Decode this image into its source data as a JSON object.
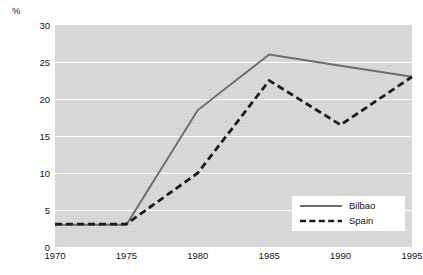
{
  "chart_data": {
    "type": "line",
    "title": "",
    "subtitle": "",
    "xlabel": "",
    "ylabel": "%",
    "x": [
      1970,
      1975,
      1980,
      1985,
      1990,
      1995
    ],
    "xtick_labels": [
      "1970",
      "1975",
      "1980",
      "1985",
      "1990",
      "1995"
    ],
    "ytick_labels": [
      "0",
      "5",
      "10",
      "15",
      "20",
      "25",
      "30"
    ],
    "yticks": [
      0,
      5,
      10,
      15,
      20,
      25,
      30
    ],
    "ylim": [
      0,
      30
    ],
    "xlim": [
      1970,
      1995
    ],
    "grid": "horizontal",
    "legend_position": "bottom-right",
    "plot_background": "#d6d6d6",
    "gridline_color": "#ffffff",
    "series": [
      {
        "name": "Bilbao",
        "style": "solid",
        "color": "#6b6b6b",
        "values": [
          3.0,
          3.0,
          18.5,
          26.0,
          24.5,
          23.0
        ]
      },
      {
        "name": "Spain",
        "style": "dashed",
        "color": "#1c1c1c",
        "values": [
          3.1,
          3.1,
          10.0,
          22.5,
          16.5,
          23.0
        ]
      }
    ]
  },
  "legend": {
    "items": [
      {
        "label": "Bilbao",
        "style": "solid"
      },
      {
        "label": "Spain",
        "style": "dashed"
      }
    ]
  },
  "axis": {
    "unit": "%"
  }
}
